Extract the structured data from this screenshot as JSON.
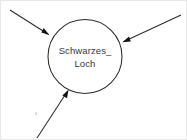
{
  "diagram": {
    "type": "node-with-incoming-arrows",
    "background_color": "#ffffff",
    "stroke_color": "#2b2b2b",
    "text_color": "#3a3a3a",
    "node": {
      "name": "schwarzes-loch",
      "label_line1": "Schwarzes_",
      "label_line2": "Loch",
      "shape": "circle",
      "center_x": 84,
      "center_y": 55,
      "radius": 37
    },
    "edges": [
      {
        "name": "incoming-arrow-top-left",
        "direction": "into-node",
        "from_x": 9,
        "from_y": 9,
        "to_x": 47,
        "to_y": 33,
        "label": ""
      },
      {
        "name": "incoming-arrow-top-right",
        "direction": "into-node",
        "from_x": 180,
        "from_y": 14,
        "to_x": 122,
        "to_y": 41,
        "label": ""
      },
      {
        "name": "incoming-arrow-bottom-left",
        "direction": "into-node",
        "from_x": 36,
        "from_y": 137,
        "to_x": 67,
        "to_y": 89,
        "label": ""
      }
    ]
  }
}
